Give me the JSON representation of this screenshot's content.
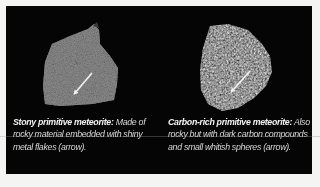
{
  "figure": {
    "background_color": "#050505",
    "page_color": "#f4f4f3",
    "specimens": [
      {
        "name": "stony-primitive-meteorite",
        "caption_title": "Stony primitive meteorite:",
        "caption_body": " Made of rocky material embedded with shiny metal flakes (arrow).",
        "texture_color": "#8a8a8a",
        "arrow": "white arrow pointing to metal flakes"
      },
      {
        "name": "carbon-rich-primitive-meteorite",
        "caption_title": "Carbon-rich primitive meteorite:",
        "caption_body": " Also rocky but with dark carbon compounds and small whitish spheres (arrow).",
        "texture_color": "#3c3c3c",
        "arrow": "white arrow pointing to whitish spheres"
      }
    ]
  }
}
